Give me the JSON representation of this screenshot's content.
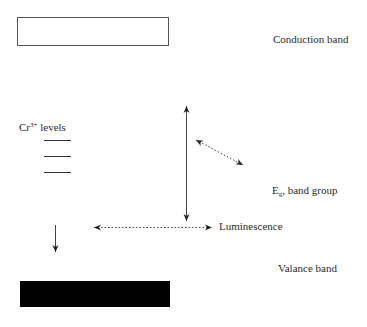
{
  "diagram": {
    "type": "energy-band-diagram",
    "labels": {
      "conduction_band": "Conduction band",
      "cr_levels_prefix": "Cr",
      "cr_levels_superscript": "3+",
      "cr_levels_suffix": " levels",
      "eg_main": "E",
      "eg_subscript": "g",
      "eg_suffix": ", band group",
      "luminescence": "Luminescence",
      "valance_band": "Valance band"
    },
    "elements": {
      "conduction_band_box": {
        "x": 17,
        "y": 17,
        "width": 151,
        "height": 28,
        "fill": "#ffffff",
        "stroke": "#555555"
      },
      "valance_band_box": {
        "x": 20,
        "y": 281,
        "width": 150,
        "height": 26,
        "fill": "#000000"
      },
      "cr_level_lines": [
        {
          "x1": 44,
          "x2": 71,
          "y": 140
        },
        {
          "x1": 44,
          "x2": 71,
          "y": 156
        },
        {
          "x1": 44,
          "x2": 71,
          "y": 172
        }
      ],
      "band_gap_arrow": {
        "x": 186,
        "y1": 105,
        "y2": 222,
        "style": "solid",
        "heads": "both"
      },
      "diagonal_arrow": {
        "x1": 195,
        "y1": 140,
        "x2": 243,
        "y2": 165,
        "style": "dotted",
        "heads": "both"
      },
      "luminescence_arrow": {
        "x1": 93,
        "x2": 212,
        "y": 227,
        "style": "dotted",
        "heads": "both"
      },
      "cr_down_arrow": {
        "x": 55,
        "y1": 225,
        "y2": 253,
        "style": "solid",
        "heads": "end"
      }
    }
  }
}
